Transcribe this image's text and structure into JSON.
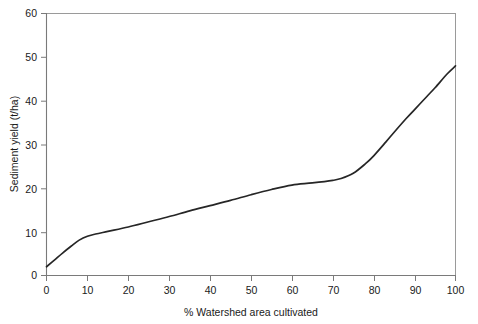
{
  "chart_data": {
    "type": "line",
    "title": "",
    "xlabel": "% Watershed area cultivated",
    "ylabel": "Sediment yield (t/ha)",
    "xlim": [
      0,
      100
    ],
    "ylim": [
      0,
      60
    ],
    "xticks": [
      0,
      10,
      20,
      30,
      40,
      50,
      60,
      70,
      80,
      90,
      100
    ],
    "yticks": [
      0,
      10,
      20,
      30,
      40,
      50,
      60
    ],
    "xtick_labels": [
      "0",
      "10",
      "20",
      "30",
      "40",
      "50",
      "60",
      "70",
      "80",
      "90",
      "100"
    ],
    "ytick_labels": [
      "0",
      "10",
      "20",
      "30",
      "40",
      "50",
      "60"
    ],
    "grid": false,
    "legend": null,
    "series": [
      {
        "name": "Sediment yield",
        "color": "#262626",
        "x": [
          0,
          2,
          4,
          6,
          8,
          10,
          12,
          15,
          20,
          25,
          30,
          35,
          40,
          45,
          50,
          55,
          60,
          65,
          70,
          72,
          75,
          78,
          80,
          83,
          85,
          88,
          90,
          93,
          95,
          98,
          100
        ],
        "values": [
          2.0,
          3.6,
          5.2,
          6.7,
          8.1,
          9.0,
          9.5,
          10.1,
          11.1,
          12.3,
          13.5,
          14.8,
          16.0,
          17.2,
          18.5,
          19.7,
          20.7,
          21.2,
          21.8,
          22.2,
          23.4,
          25.6,
          27.4,
          30.6,
          32.8,
          36.0,
          38.0,
          41.0,
          43.0,
          46.2,
          48.0
        ]
      }
    ],
    "annotations": []
  },
  "axis": {
    "frame_color": "#9a9a9a",
    "axis_color": "#7a7a7a",
    "curve_color": "#262626"
  }
}
